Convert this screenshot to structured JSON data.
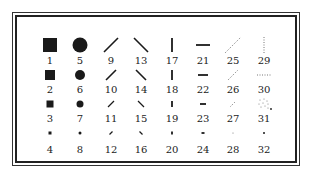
{
  "columns": [
    {
      "type": "square",
      "x": 50
    },
    {
      "type": "circle",
      "x": 80
    },
    {
      "type": "slash",
      "x": 111
    },
    {
      "type": "backslash",
      "x": 141
    },
    {
      "type": "vbar",
      "x": 172
    },
    {
      "type": "hbar",
      "x": 203
    },
    {
      "type": "dotted-slash",
      "x": 233
    },
    {
      "type": "dotted-mixed",
      "x": 264
    }
  ],
  "rows_y": {
    "symbols": [
      45,
      75,
      104,
      133
    ],
    "labels": [
      61,
      90,
      119,
      150
    ]
  },
  "symbols": [
    {
      "id": 1,
      "label": "1",
      "col": 0,
      "row": 0,
      "shape": "square",
      "size": 14
    },
    {
      "id": 2,
      "label": "2",
      "col": 0,
      "row": 1,
      "shape": "square",
      "size": 10
    },
    {
      "id": 3,
      "label": "3",
      "col": 0,
      "row": 2,
      "shape": "square",
      "size": 7
    },
    {
      "id": 4,
      "label": "4",
      "col": 0,
      "row": 3,
      "shape": "square",
      "size": 3
    },
    {
      "id": 5,
      "label": "5",
      "col": 1,
      "row": 0,
      "shape": "circle",
      "size": 15
    },
    {
      "id": 6,
      "label": "6",
      "col": 1,
      "row": 1,
      "shape": "circle",
      "size": 10
    },
    {
      "id": 7,
      "label": "7",
      "col": 1,
      "row": 2,
      "shape": "circle",
      "size": 7
    },
    {
      "id": 8,
      "label": "8",
      "col": 1,
      "row": 3,
      "shape": "circle",
      "size": 3
    },
    {
      "id": 9,
      "label": "9",
      "col": 2,
      "row": 0,
      "shape": "slash",
      "size": 14
    },
    {
      "id": 10,
      "label": "10",
      "col": 2,
      "row": 1,
      "shape": "slash",
      "size": 10
    },
    {
      "id": 11,
      "label": "11",
      "col": 2,
      "row": 2,
      "shape": "slash",
      "size": 6
    },
    {
      "id": 12,
      "label": "12",
      "col": 2,
      "row": 3,
      "shape": "slash",
      "size": 3
    },
    {
      "id": 13,
      "label": "13",
      "col": 3,
      "row": 0,
      "shape": "backslash",
      "size": 14
    },
    {
      "id": 14,
      "label": "14",
      "col": 3,
      "row": 1,
      "shape": "backslash",
      "size": 10
    },
    {
      "id": 15,
      "label": "15",
      "col": 3,
      "row": 2,
      "shape": "backslash",
      "size": 6
    },
    {
      "id": 16,
      "label": "16",
      "col": 3,
      "row": 3,
      "shape": "backslash",
      "size": 3
    },
    {
      "id": 17,
      "label": "17",
      "col": 4,
      "row": 0,
      "shape": "vbar",
      "size": 14
    },
    {
      "id": 18,
      "label": "18",
      "col": 4,
      "row": 1,
      "shape": "vbar",
      "size": 10
    },
    {
      "id": 19,
      "label": "19",
      "col": 4,
      "row": 2,
      "shape": "vbar",
      "size": 6
    },
    {
      "id": 20,
      "label": "20",
      "col": 4,
      "row": 3,
      "shape": "vbar",
      "size": 3
    },
    {
      "id": 21,
      "label": "21",
      "col": 5,
      "row": 0,
      "shape": "hbar",
      "size": 14
    },
    {
      "id": 22,
      "label": "22",
      "col": 5,
      "row": 1,
      "shape": "hbar",
      "size": 10
    },
    {
      "id": 23,
      "label": "23",
      "col": 5,
      "row": 2,
      "shape": "hbar",
      "size": 6
    },
    {
      "id": 24,
      "label": "24",
      "col": 5,
      "row": 3,
      "shape": "hbar",
      "size": 3
    },
    {
      "id": 25,
      "label": "25",
      "col": 6,
      "row": 0,
      "shape": "dotted-slash",
      "size": 16
    },
    {
      "id": 26,
      "label": "26",
      "col": 6,
      "row": 1,
      "shape": "dotted-slash",
      "size": 10
    },
    {
      "id": 27,
      "label": "27",
      "col": 6,
      "row": 2,
      "shape": "dotted-slash",
      "size": 5
    },
    {
      "id": 28,
      "label": "28",
      "col": 6,
      "row": 3,
      "shape": "dot",
      "size": 1
    },
    {
      "id": 29,
      "label": "29",
      "col": 7,
      "row": 0,
      "shape": "dotted-vbar",
      "size": 16
    },
    {
      "id": 30,
      "label": "30",
      "col": 7,
      "row": 1,
      "shape": "dotted-hbar",
      "size": 14
    },
    {
      "id": 31,
      "label": "31",
      "col": 7,
      "row": 2,
      "shape": "dotted-cluster",
      "size": 10
    },
    {
      "id": 32,
      "label": "32",
      "col": 7,
      "row": 3,
      "shape": "dot",
      "size": 2
    }
  ],
  "colors": {
    "ink": "#1a1a1a",
    "faint": "#777777",
    "border": "#222222",
    "background": "#ffffff"
  }
}
